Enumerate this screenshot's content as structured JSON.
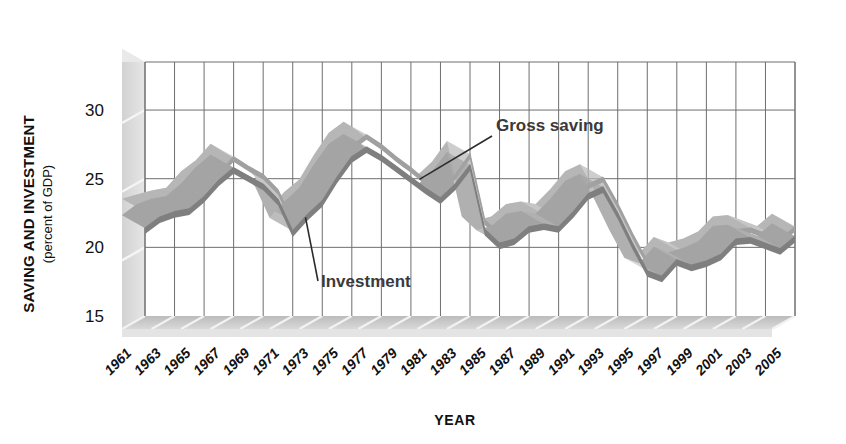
{
  "chart_data": {
    "type": "line",
    "title": "",
    "xlabel": "YEAR",
    "ylabel": "SAVING AND INVESTMENT",
    "ylabel_sub": "(percent of GDP)",
    "ylim": [
      15,
      33.5
    ],
    "yticks": [
      30,
      25,
      20,
      15
    ],
    "ytick_labels": [
      "30",
      "25",
      "20",
      "15"
    ],
    "xlim": [
      1961,
      2005
    ],
    "grid": true,
    "legend_position": "inline-annotations",
    "annotations": [
      {
        "text": "Gross saving",
        "series": "Gross saving",
        "points_to_year": 1981
      },
      {
        "text": "Investment",
        "series": "Investment",
        "points_to_year": 1971
      }
    ],
    "x": [
      1961,
      1962,
      1963,
      1964,
      1965,
      1966,
      1967,
      1968,
      1969,
      1970,
      1971,
      1972,
      1973,
      1974,
      1975,
      1976,
      1977,
      1978,
      1979,
      1980,
      1981,
      1982,
      1983,
      1984,
      1985,
      1986,
      1987,
      1988,
      1989,
      1990,
      1991,
      1992,
      1993,
      1994,
      1995,
      1996,
      1997,
      1998,
      1999,
      2000,
      2001,
      2002,
      2003,
      2004,
      2005
    ],
    "series": [
      {
        "name": "Gross saving",
        "color": "#b8b8b8",
        "values": [
          22.6,
          22.9,
          23.2,
          23.4,
          24.6,
          25.4,
          26.6,
          25.9,
          25.3,
          24.2,
          21.9,
          23.1,
          24.0,
          25.8,
          27.4,
          28.2,
          27.5,
          26.6,
          25.8,
          24.9,
          24.3,
          25.3,
          26.8,
          22.0,
          21.0,
          21.3,
          22.2,
          22.4,
          22.2,
          23.3,
          24.6,
          25.1,
          23.2,
          21.0,
          19.0,
          18.6,
          19.8,
          19.4,
          19.7,
          20.2,
          21.3,
          21.4,
          21.0,
          20.6,
          21.5
        ]
      },
      {
        "name": "Investment",
        "color": "#8a8a8a",
        "values": [
          21.4,
          22.2,
          22.6,
          22.8,
          23.7,
          24.9,
          25.8,
          25.2,
          24.6,
          23.5,
          21.2,
          22.4,
          23.4,
          25.1,
          26.6,
          27.3,
          26.7,
          25.9,
          25.1,
          24.3,
          23.6,
          24.6,
          26.0,
          21.3,
          20.3,
          20.6,
          21.5,
          21.7,
          21.5,
          22.6,
          23.9,
          24.4,
          22.5,
          20.3,
          18.3,
          17.9,
          19.1,
          18.7,
          19.0,
          19.5,
          20.6,
          20.7,
          20.3,
          19.9,
          20.8
        ]
      }
    ]
  },
  "y_axis": {
    "title": "SAVING AND INVESTMENT",
    "subtitle": "(percent of GDP)",
    "ticks": [
      "30",
      "25",
      "20",
      "15"
    ]
  },
  "x_axis": {
    "title": "YEAR",
    "tick_labels": [
      "1961",
      "1963",
      "1965",
      "1967",
      "1969",
      "1971",
      "1973",
      "1975",
      "1977",
      "1979",
      "1981",
      "1983",
      "1985",
      "1987",
      "1989",
      "1991",
      "1993",
      "1995",
      "1997",
      "1999",
      "2001",
      "2003",
      "2005"
    ]
  },
  "labels": {
    "gross_saving": "Gross saving",
    "investment": "Investment"
  },
  "colors": {
    "gross_saving_band": "#bfbfbf",
    "investment_line": "#8c8c8c",
    "grid": "#6e6e6e",
    "floor": "#c9c9c9",
    "wall": "#dcdcdc",
    "text": "#111111"
  }
}
